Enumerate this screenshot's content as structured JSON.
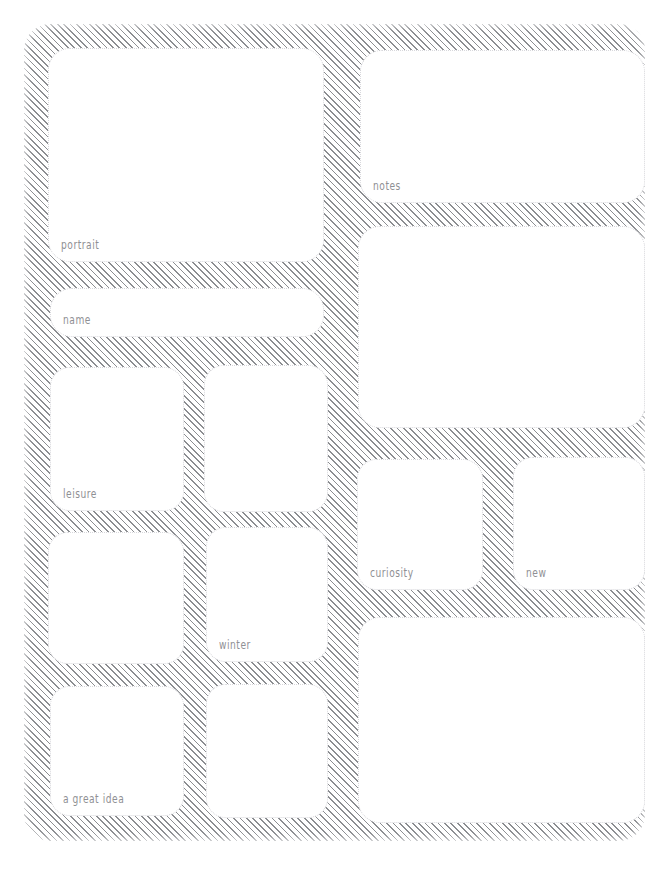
{
  "page": {
    "style": "hand-drawn hatched wireframe",
    "background_color": "#ffffff",
    "hatch_color": "#828488",
    "card_fill": "#ffffff",
    "card_border_color": "#d8d8dc",
    "label_color": "#8f9094"
  },
  "left_column": {
    "cards": [
      {
        "id": "portrait",
        "label": "portrait",
        "has_label": true
      },
      {
        "id": "name",
        "label": "name",
        "has_label": true
      },
      {
        "id": "leisure",
        "label": "leisure",
        "has_label": true
      },
      {
        "id": "blank-a",
        "label": "",
        "has_label": false
      },
      {
        "id": "blank-b",
        "label": "",
        "has_label": false
      },
      {
        "id": "winter",
        "label": "winter",
        "has_label": true
      },
      {
        "id": "great-idea",
        "label": "a great idea",
        "has_label": true
      },
      {
        "id": "blank-c",
        "label": "",
        "has_label": false
      }
    ]
  },
  "right_column": {
    "cards": [
      {
        "id": "notes",
        "label": "notes",
        "has_label": true
      },
      {
        "id": "blank-d",
        "label": "",
        "has_label": false
      },
      {
        "id": "curiosity",
        "label": "curiosity",
        "has_label": true
      },
      {
        "id": "new",
        "label": "new",
        "has_label": true
      },
      {
        "id": "blank-e",
        "label": "",
        "has_label": false
      }
    ]
  }
}
